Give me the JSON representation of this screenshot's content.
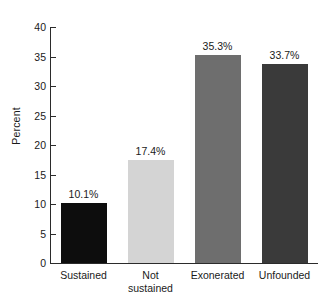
{
  "chart_data": {
    "type": "bar",
    "title": "",
    "subtitle": "",
    "xlabel": "",
    "ylabel": "Percent",
    "categories": [
      "Sustained",
      "Not sustained",
      "Exonerated",
      "Unfounded"
    ],
    "category_lines": [
      [
        "Sustained"
      ],
      [
        "Not",
        "sustained"
      ],
      [
        "Exonerated"
      ],
      [
        "Unfounded"
      ]
    ],
    "values": [
      10.1,
      17.4,
      35.3,
      33.7
    ],
    "value_labels": [
      "10.1%",
      "17.4%",
      "35.3%",
      "33.7%"
    ],
    "bar_colors": [
      "#0d0d0d",
      "#d4d4d4",
      "#6e6e6e",
      "#3a3a3a"
    ],
    "ylim": [
      0,
      40
    ],
    "yticks": [
      0,
      5,
      10,
      15,
      20,
      25,
      30,
      35,
      40
    ],
    "ytick_labels": [
      "0",
      "5",
      "10",
      "15",
      "20",
      "25",
      "30",
      "35",
      "40"
    ],
    "grid": false,
    "legend": "none",
    "background_color": "#ffffff",
    "axis_color": "#2b2b2b"
  }
}
